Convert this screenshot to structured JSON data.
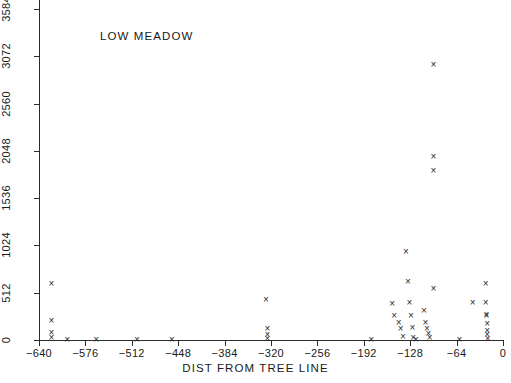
{
  "chart_data": {
    "type": "scatter",
    "title": "LOW MEADOW",
    "xlabel": "DIST FROM TREE LINE",
    "ylabel": "",
    "xlim": [
      -640,
      0
    ],
    "ylim": [
      0,
      3584
    ],
    "grid": false,
    "legend": null,
    "marker": "x",
    "xticks": [
      -640,
      -576,
      -512,
      -448,
      -384,
      -320,
      -256,
      -192,
      -128,
      -64,
      0
    ],
    "xticklabels": [
      "-640",
      "-576",
      "-512",
      "-448",
      "-384",
      "-320",
      "-256",
      "-192",
      "-128",
      "-64",
      "0"
    ],
    "yticks": [
      0,
      512,
      1024,
      1536,
      2048,
      2560,
      3072,
      3584
    ],
    "yticklabels": [
      "0",
      "512",
      "1024",
      "1536",
      "2048",
      "2560",
      "3072",
      "3584"
    ],
    "points": [
      {
        "x": -623,
        "y": 611
      },
      {
        "x": -623,
        "y": 216
      },
      {
        "x": -623,
        "y": 78
      },
      {
        "x": -623,
        "y": 22
      },
      {
        "x": -601,
        "y": 2
      },
      {
        "x": -561,
        "y": 6
      },
      {
        "x": -505,
        "y": 4
      },
      {
        "x": -457,
        "y": 10
      },
      {
        "x": -327,
        "y": 440
      },
      {
        "x": -325,
        "y": 126
      },
      {
        "x": -325,
        "y": 58
      },
      {
        "x": -325,
        "y": 16
      },
      {
        "x": -182,
        "y": 9
      },
      {
        "x": -153,
        "y": 400
      },
      {
        "x": -150,
        "y": 268
      },
      {
        "x": -144,
        "y": 186
      },
      {
        "x": -141,
        "y": 124
      },
      {
        "x": -138,
        "y": 34
      },
      {
        "x": -134,
        "y": 962
      },
      {
        "x": -131,
        "y": 636
      },
      {
        "x": -129,
        "y": 411
      },
      {
        "x": -127,
        "y": 260
      },
      {
        "x": -125,
        "y": 133
      },
      {
        "x": -124,
        "y": 26
      },
      {
        "x": -120,
        "y": 2
      },
      {
        "x": -109,
        "y": 316
      },
      {
        "x": -107,
        "y": 190
      },
      {
        "x": -105,
        "y": 121
      },
      {
        "x": -103,
        "y": 72
      },
      {
        "x": -101,
        "y": 26
      },
      {
        "x": -96,
        "y": 2985
      },
      {
        "x": -96,
        "y": 1985
      },
      {
        "x": -96,
        "y": 1833
      },
      {
        "x": -96,
        "y": 560
      },
      {
        "x": -60,
        "y": 6
      },
      {
        "x": -42,
        "y": 408
      },
      {
        "x": -24,
        "y": 617
      },
      {
        "x": -24,
        "y": 411
      },
      {
        "x": -23,
        "y": 278
      },
      {
        "x": -23,
        "y": 262
      },
      {
        "x": -22,
        "y": 184
      },
      {
        "x": -22,
        "y": 108
      },
      {
        "x": -22,
        "y": 62
      },
      {
        "x": -21,
        "y": 16
      }
    ]
  }
}
